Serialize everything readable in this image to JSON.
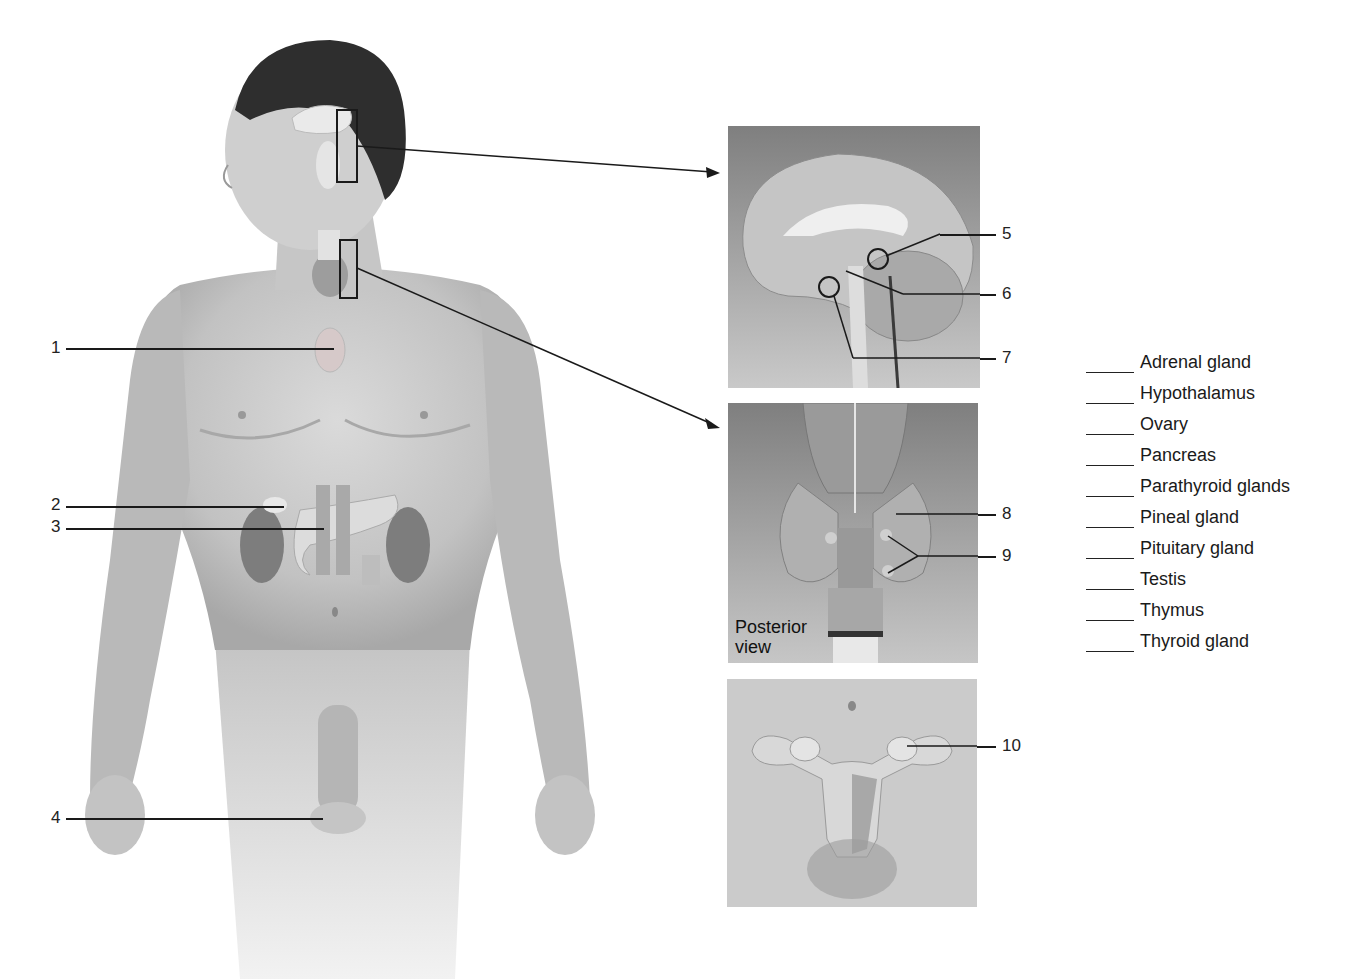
{
  "figure": {
    "colors": {
      "skin_light": "#d9d9d9",
      "skin_mid": "#bdbdbd",
      "skin_dark": "#9a9a9a",
      "hair": "#2a2a2a",
      "panel_bg_top": "#8a8a8a",
      "panel_bg_bottom": "#c8c8c8",
      "line": "#1a1a1a"
    }
  },
  "body_labels": [
    {
      "number": "1",
      "target": "thymus-region"
    },
    {
      "number": "2",
      "target": "adrenal-region"
    },
    {
      "number": "3",
      "target": "pancreas-region"
    },
    {
      "number": "4",
      "target": "testis-region"
    }
  ],
  "panels": {
    "brain": {
      "labels": [
        {
          "number": "5",
          "target": "pineal-region"
        },
        {
          "number": "6",
          "target": "hypothalamus-region"
        },
        {
          "number": "7",
          "target": "pituitary-region"
        }
      ]
    },
    "thyroid": {
      "caption_line1": "Posterior",
      "caption_line2": "view",
      "labels": [
        {
          "number": "8",
          "target": "thyroid-region"
        },
        {
          "number": "9",
          "target": "parathyroid-region"
        }
      ]
    },
    "pelvis": {
      "labels": [
        {
          "number": "10",
          "target": "ovary-region"
        }
      ]
    }
  },
  "word_bank": [
    {
      "blank": "",
      "term": "Adrenal gland"
    },
    {
      "blank": "",
      "term": "Hypothalamus"
    },
    {
      "blank": "",
      "term": "Ovary"
    },
    {
      "blank": "",
      "term": "Pancreas"
    },
    {
      "blank": "",
      "term": "Parathyroid glands"
    },
    {
      "blank": "",
      "term": "Pineal gland"
    },
    {
      "blank": "",
      "term": "Pituitary gland"
    },
    {
      "blank": "",
      "term": "Testis"
    },
    {
      "blank": "",
      "term": "Thymus"
    },
    {
      "blank": "",
      "term": "Thyroid gland"
    }
  ]
}
